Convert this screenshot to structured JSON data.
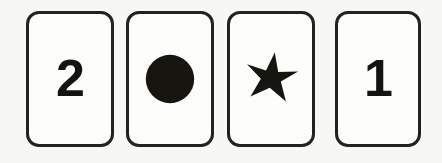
{
  "scene": {
    "title": "four-cards-row",
    "background_color": "#f7f7f5",
    "width": 442,
    "height": 163
  },
  "style": {
    "card_fill": "#fdfdfc",
    "card_border_color": "#23221f",
    "ink_color": "#16150f"
  },
  "cards": [
    {
      "id": "card-1",
      "face_type": "number",
      "label": "2",
      "icon_name": "digit-two-glyph",
      "x": 26,
      "y": 11,
      "width": 88,
      "height": 136
    },
    {
      "id": "card-2",
      "face_type": "shape",
      "label": "",
      "icon_name": "filled-circle-icon",
      "x": 126,
      "y": 11,
      "width": 88,
      "height": 136
    },
    {
      "id": "card-3",
      "face_type": "shape",
      "label": "",
      "icon_name": "six-pointed-star-icon",
      "x": 227,
      "y": 11,
      "width": 88,
      "height": 136
    },
    {
      "id": "card-4",
      "face_type": "number",
      "label": "1",
      "icon_name": "digit-one-glyph",
      "x": 335,
      "y": 11,
      "width": 86,
      "height": 136
    }
  ]
}
